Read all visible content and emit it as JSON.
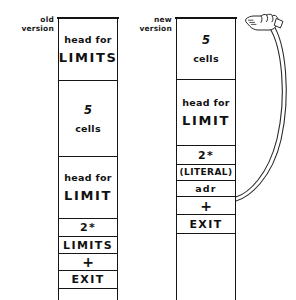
{
  "diagram": {
    "ink_color": "#151515",
    "background_color": "#ffffff"
  },
  "old_column": {
    "label_line1": "old",
    "label_line2": "version",
    "cells": [
      {
        "name": "head-cell",
        "line1": "head for",
        "line2": "LIMITS"
      },
      {
        "name": "body-cell",
        "line1": "5",
        "line2": "cells"
      },
      {
        "name": "head-cell-2",
        "line1": "head for",
        "line2": "LIMIT"
      },
      {
        "name": "op-cell",
        "line1": "2*"
      },
      {
        "name": "op-cell",
        "line1": "LIMITS"
      },
      {
        "name": "op-cell",
        "line1": "+"
      },
      {
        "name": "op-cell",
        "line1": "EXIT"
      }
    ]
  },
  "new_column": {
    "label_line1": "new",
    "label_line2": "version",
    "cells": [
      {
        "name": "body-cell",
        "line1": "5",
        "line2": "cells"
      },
      {
        "name": "head-cell",
        "line1": "head for",
        "line2": "LIMIT"
      },
      {
        "name": "op-cell",
        "line1": "2*"
      },
      {
        "name": "op-cell",
        "line1": "(LITERAL)"
      },
      {
        "name": "op-cell",
        "line1": "adr"
      },
      {
        "name": "op-cell",
        "line1": "+"
      },
      {
        "name": "op-cell",
        "line1": "EXIT"
      }
    ]
  },
  "annotation": {
    "pointer_icon": "pointing-hand-icon",
    "arrow_icon": "curved-arrow-icon",
    "points_from_cell": "adr",
    "points_to_cell": "5 cells"
  }
}
